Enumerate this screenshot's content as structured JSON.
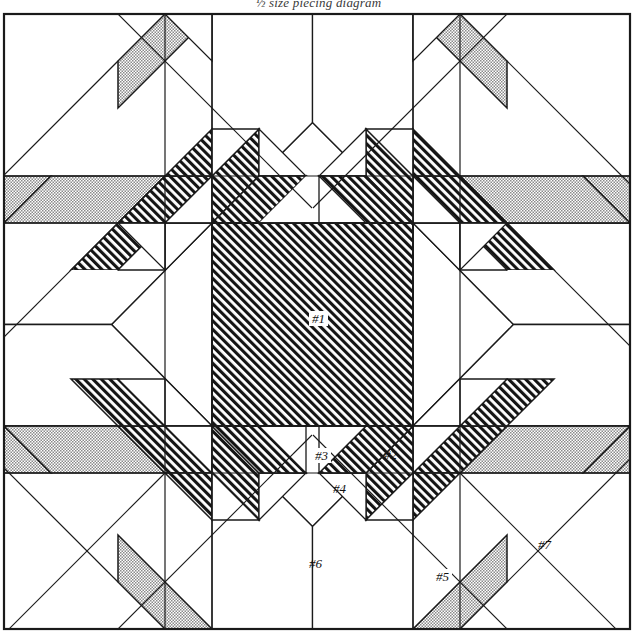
{
  "caption": "½ size piecing diagram",
  "figure": {
    "type": "quilt-piecing-diagram",
    "block_name": "Feathered Star",
    "canvas": {
      "width": 637,
      "height": 640
    },
    "border": {
      "x": 4,
      "y": 14,
      "width": 626,
      "height": 615,
      "stroke": "#1a1a1a",
      "stroke_width": 2
    },
    "grid": {
      "vertical_lines": [
        4,
        165,
        212,
        413,
        460,
        630
      ],
      "horizontal_lines": [
        14,
        176,
        223,
        426,
        473,
        629
      ],
      "cell": 47
    },
    "center_square": {
      "x": 212,
      "y": 223,
      "width": 201,
      "height": 203,
      "fill": "hatch"
    },
    "fills": {
      "white": "#ffffff",
      "hatch": "diagonal-hatch-45",
      "stipple": "dotted-stipple-50",
      "line": "#1a1a1a"
    }
  },
  "labels": [
    {
      "id": "label-1",
      "text": "#1",
      "x": 320,
      "y": 320,
      "boxed": true
    },
    {
      "id": "label-2",
      "text": "#2",
      "x": 393,
      "y": 457,
      "boxed": false
    },
    {
      "id": "label-3",
      "text": "#3",
      "x": 323,
      "y": 457,
      "boxed": true
    },
    {
      "id": "label-4",
      "text": "#4",
      "x": 342,
      "y": 491,
      "boxed": false
    },
    {
      "id": "label-5",
      "text": "#5",
      "x": 450,
      "y": 578,
      "boxed": true
    },
    {
      "id": "label-6",
      "text": "#6",
      "x": 319,
      "y": 566,
      "boxed": false
    },
    {
      "id": "label-7",
      "text": "#7",
      "x": 547,
      "y": 547,
      "boxed": false
    }
  ],
  "legend_note": {
    "piece_1": "center square",
    "piece_2": "large background triangle",
    "piece_3": "feather triangle (dark)",
    "piece_4": "feather triangle (light)",
    "piece_5": "corner kite / stipple",
    "piece_6": "corner background square",
    "piece_7": "outer corner square"
  }
}
